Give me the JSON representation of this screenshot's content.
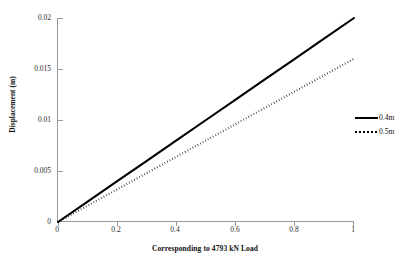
{
  "chart_data": {
    "type": "line",
    "title": "",
    "xlabel": "Corresponding to 4793 kN Load",
    "ylabel": "Displacement (m)",
    "xlim": [
      0,
      1
    ],
    "ylim": [
      0,
      0.02
    ],
    "grid": false,
    "legend_position": "right",
    "x_ticks": [
      "0",
      "0.2",
      "0.4",
      "0.6",
      "0.8",
      "1"
    ],
    "x_tick_values": [
      0,
      0.2,
      0.4,
      0.6,
      0.8,
      1
    ],
    "y_ticks": [
      "0",
      "0.005",
      "0.01",
      "0.015",
      "0.02"
    ],
    "y_tick_values": [
      0,
      0.005,
      0.01,
      0.015,
      0.02
    ],
    "x": [
      0,
      0.1,
      0.2,
      0.3,
      0.4,
      0.5,
      0.6,
      0.7,
      0.8,
      0.9,
      1
    ],
    "series": [
      {
        "name": "0.4m",
        "style": "solid",
        "color": "#000000",
        "values": [
          0,
          0.002,
          0.004,
          0.006,
          0.008,
          0.01,
          0.012,
          0.014,
          0.016,
          0.018,
          0.02
        ]
      },
      {
        "name": "0.5m",
        "style": "dotted",
        "color": "#000000",
        "values": [
          0,
          0.0016,
          0.0032,
          0.0048,
          0.0064,
          0.008,
          0.0096,
          0.0112,
          0.0128,
          0.0144,
          0.016
        ]
      }
    ]
  },
  "legend": {
    "items": [
      {
        "label": "0.4m",
        "swatch": "solid-line-swatch"
      },
      {
        "label": "0.5m",
        "swatch": "dotted-line-swatch"
      }
    ]
  },
  "axes": {
    "x_title": "Corresponding to 4793 kN Load",
    "y_title": "Displacement (m)",
    "x_tick_labels": [
      "0",
      "0.2",
      "0.4",
      "0.6",
      "0.8",
      "1"
    ],
    "y_tick_labels": [
      "0",
      "0.005",
      "0.01",
      "0.015",
      "0.02"
    ]
  },
  "colors": {
    "axis": "#9a9a9a",
    "series_1": "#000000",
    "series_2": "#000000",
    "text": "#111111",
    "background": "#ffffff"
  }
}
